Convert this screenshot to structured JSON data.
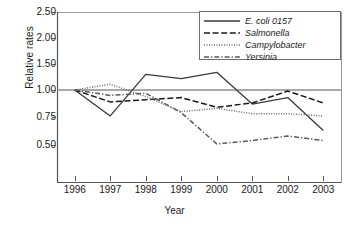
{
  "chart_data": {
    "type": "line",
    "title": "",
    "xlabel": "Year",
    "ylabel": "Relative rates",
    "x": [
      1996,
      1997,
      1998,
      1999,
      2000,
      2001,
      2002,
      2003
    ],
    "categories": [
      "1996",
      "1997",
      "1998",
      "1999",
      "2000",
      "2001",
      "2002",
      "2003"
    ],
    "yticks": [
      2.5,
      2.0,
      1.5,
      1.0,
      0.75,
      0.5
    ],
    "ytick_labels": [
      "2.50",
      "2.00",
      "1.50",
      "1.00",
      "0.75",
      "0.50"
    ],
    "ylim": [
      0.44,
      2.5
    ],
    "grid": false,
    "legend_position": "top-right",
    "reference_line": 1.0,
    "series": [
      {
        "name": "E. coli 0157",
        "style": "solid",
        "color": "#3a3a3a",
        "values": [
          1.0,
          0.76,
          1.3,
          1.22,
          1.34,
          0.87,
          0.93,
          0.63
        ]
      },
      {
        "name": "Salmonella",
        "style": "dashed",
        "color": "#1a1a1a",
        "values": [
          1.0,
          0.89,
          0.91,
          0.93,
          0.84,
          0.88,
          0.99,
          0.88
        ]
      },
      {
        "name": "Campylobacter",
        "style": "dotted",
        "color": "#6b6b6b",
        "values": [
          1.0,
          1.11,
          0.94,
          0.8,
          0.83,
          0.78,
          0.78,
          0.76
        ]
      },
      {
        "name": "Yersinia",
        "style": "dash-dot",
        "color": "#5a5a5a",
        "values": [
          1.0,
          0.95,
          0.97,
          0.79,
          0.51,
          0.54,
          0.58,
          0.54
        ]
      }
    ]
  },
  "legend": {
    "items": [
      {
        "label": "E. coli 0157",
        "style": "solid"
      },
      {
        "label": "Salmonella",
        "style": "dashed"
      },
      {
        "label": "Campylobacter",
        "style": "dotted"
      },
      {
        "label": "Yersinia",
        "style": "dash-dot"
      }
    ]
  }
}
